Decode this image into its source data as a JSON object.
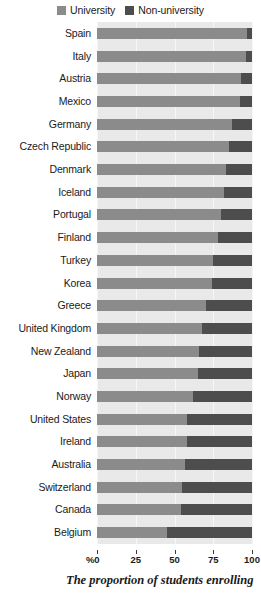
{
  "legend": {
    "entries": [
      {
        "label": "University",
        "color": "#8b8b8b"
      },
      {
        "label": "Non-university",
        "color": "#4d4d4d"
      }
    ]
  },
  "axis": {
    "percent_symbol": "%",
    "ticks": [
      "0",
      "25",
      "50",
      "75",
      "100"
    ]
  },
  "caption": {
    "line1": "The proportion of students enrolling"
  },
  "chart_data": {
    "type": "bar",
    "orientation": "horizontal",
    "stacked": true,
    "title": "",
    "xlabel": "%",
    "ylabel": "",
    "xlim": [
      0,
      100
    ],
    "grid": true,
    "legend_position": "top-center",
    "categories": [
      "Spain",
      "Italy",
      "Austria",
      "Mexico",
      "Germany",
      "Czech Republic",
      "Denmark",
      "Iceland",
      "Portugal",
      "Finland",
      "Turkey",
      "Korea",
      "Greece",
      "United Kingdom",
      "New Zealand",
      "Japan",
      "Norway",
      "United States",
      "Ireland",
      "Australia",
      "Switzerland",
      "Canada",
      "Belgium"
    ],
    "series": [
      {
        "name": "University",
        "color": "#8b8b8b",
        "values": [
          97,
          96,
          93,
          92,
          87,
          85,
          83,
          82,
          80,
          78,
          75,
          74,
          70,
          68,
          66,
          65,
          62,
          58,
          58,
          57,
          55,
          54,
          45
        ]
      },
      {
        "name": "Non-university",
        "color": "#4d4d4d",
        "values": [
          3,
          4,
          7,
          8,
          13,
          15,
          17,
          18,
          20,
          22,
          25,
          26,
          30,
          32,
          34,
          35,
          38,
          42,
          42,
          43,
          45,
          46,
          55
        ]
      }
    ],
    "xticks": [
      0,
      25,
      50,
      75,
      100
    ]
  }
}
